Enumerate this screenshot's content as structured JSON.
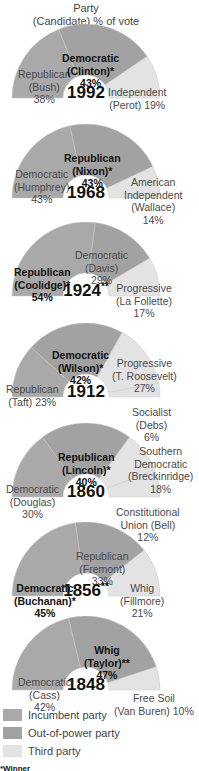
{
  "header": {
    "line1": "Party",
    "line2": "(Candidate) % of vote"
  },
  "colors": {
    "incumbent": "#a9a9a9",
    "out_of_power": "#a2a2a2",
    "third": "#e3e3e3"
  },
  "legend": [
    {
      "label": "Incumbent party",
      "color": "#a9a9a9"
    },
    {
      "label": "Out-of-power party",
      "color": "#a2a2a2"
    },
    {
      "label": "Third party",
      "color": "#e3e3e3"
    }
  ],
  "footnote": "*Winner",
  "charts": [
    {
      "year": "1992",
      "mark": "",
      "labels": [
        {
          "l1": "Republican",
          "l2": "(Bush)",
          "l3": "38%",
          "win": false
        },
        {
          "l1": "Democratic",
          "l2": "(Clinton)*",
          "l3": "43%",
          "win": true
        },
        {
          "l1": "Independent",
          "l2": "(Perot) 19%",
          "l3": "",
          "win": false
        }
      ]
    },
    {
      "year": "1968",
      "mark": "",
      "labels": [
        {
          "l1": "Democratic",
          "l2": "(Humphrey)",
          "l3": "43%",
          "win": false
        },
        {
          "l1": "Republican",
          "l2": "(Nixon)*",
          "l3": "43%",
          "win": true
        },
        {
          "l1": "American",
          "l2": "Independent",
          "l3": "(Wallace)",
          "l4": "14%",
          "win": false
        }
      ]
    },
    {
      "year": "1924",
      "mark": "**",
      "labels": [
        {
          "l1": "Republican",
          "l2": "(Coolidge)*",
          "l3": "54%",
          "win": true
        },
        {
          "l1": "Democratic",
          "l2": "(Davis)",
          "l3": "29%",
          "win": false
        },
        {
          "l1": "Progressive",
          "l2": "(La Follette)",
          "l3": "17%",
          "win": false
        }
      ]
    },
    {
      "year": "1912",
      "mark": "",
      "labels": [
        {
          "l1": "Republican",
          "l2": "(Taft) 23%",
          "l3": "",
          "win": false
        },
        {
          "l1": "Democratic",
          "l2": "(Wilson)*",
          "l3": "42%",
          "win": true
        },
        {
          "l1": "Progressive",
          "l2": "(T. Roosevelt)",
          "l3": "27%",
          "win": false
        },
        {
          "l1": "Socialist",
          "l2": "(Debs)",
          "l3": "6%",
          "win": false
        }
      ]
    },
    {
      "year": "1860",
      "mark": "",
      "labels": [
        {
          "l1": "Democratic",
          "l2": "(Douglas)",
          "l3": "30%",
          "win": false
        },
        {
          "l1": "Republican",
          "l2": "(Lincoln)*",
          "l3": "40%",
          "win": true
        },
        {
          "l1": "Southern",
          "l2": "Democratic",
          "l3": "(Breckinridge)",
          "l4": "18%",
          "win": false
        },
        {
          "l1": "Constitutional",
          "l2": "Union (Bell)",
          "l3": "12%",
          "win": false
        }
      ]
    },
    {
      "year": "1856",
      "mark": "**",
      "labels": [
        {
          "l1": "Democratic",
          "l2": "(Buchanan)*",
          "l3": "45%",
          "win": true
        },
        {
          "l1": "Republican",
          "l2": "(Fremont)",
          "l3": "33%",
          "win": false
        },
        {
          "l1": "Whig",
          "l2": "(Fillmore)",
          "l3": "21%",
          "win": false
        }
      ]
    },
    {
      "year": "1848",
      "mark": "",
      "labels": [
        {
          "l1": "Democratic",
          "l2": "(Cass)",
          "l3": "42%",
          "win": false
        },
        {
          "l1": "Whig",
          "l2": "(Taylor)**",
          "l3": "47%",
          "win": true
        },
        {
          "l1": "Free Soil",
          "l2": "(Van Buren) 10%",
          "l3": "",
          "win": false
        }
      ]
    }
  ],
  "chart_data": {
    "type": "pie",
    "title": "Party (Candidate) % of vote",
    "legend": [
      "Incumbent party",
      "Out-of-power party",
      "Third party"
    ],
    "legend_position": "bottom",
    "charts": [
      {
        "year": 1992,
        "slices": [
          {
            "label": "Republican (Bush)",
            "value": 38,
            "role": "Incumbent party"
          },
          {
            "label": "Democratic (Clinton)*",
            "value": 43,
            "role": "Out-of-power party"
          },
          {
            "label": "Independent (Perot)",
            "value": 19,
            "role": "Third party"
          }
        ]
      },
      {
        "year": 1968,
        "slices": [
          {
            "label": "Democratic (Humphrey)",
            "value": 43,
            "role": "Incumbent party"
          },
          {
            "label": "Republican (Nixon)*",
            "value": 43,
            "role": "Out-of-power party"
          },
          {
            "label": "American Independent (Wallace)",
            "value": 14,
            "role": "Third party"
          }
        ]
      },
      {
        "year": 1924,
        "note": "**",
        "slices": [
          {
            "label": "Republican (Coolidge)*",
            "value": 54,
            "role": "Incumbent party"
          },
          {
            "label": "Democratic (Davis)",
            "value": 29,
            "role": "Out-of-power party"
          },
          {
            "label": "Progressive (La Follette)",
            "value": 17,
            "role": "Third party"
          }
        ]
      },
      {
        "year": 1912,
        "slices": [
          {
            "label": "Republican (Taft)",
            "value": 23,
            "role": "Incumbent party"
          },
          {
            "label": "Democratic (Wilson)*",
            "value": 42,
            "role": "Out-of-power party"
          },
          {
            "label": "Progressive (T. Roosevelt)",
            "value": 27,
            "role": "Third party"
          },
          {
            "label": "Socialist (Debs)",
            "value": 6,
            "role": "Third party"
          }
        ]
      },
      {
        "year": 1860,
        "slices": [
          {
            "label": "Democratic (Douglas)",
            "value": 30,
            "role": "Incumbent party"
          },
          {
            "label": "Republican (Lincoln)*",
            "value": 40,
            "role": "Out-of-power party"
          },
          {
            "label": "Southern Democratic (Breckinridge)",
            "value": 18,
            "role": "Third party"
          },
          {
            "label": "Constitutional Union (Bell)",
            "value": 12,
            "role": "Third party"
          }
        ]
      },
      {
        "year": 1856,
        "note": "**",
        "slices": [
          {
            "label": "Democratic (Buchanan)*",
            "value": 45,
            "role": "Incumbent party"
          },
          {
            "label": "Republican (Fremont)",
            "value": 33,
            "role": "Out-of-power party"
          },
          {
            "label": "Whig (Fillmore)",
            "value": 21,
            "role": "Third party"
          }
        ]
      },
      {
        "year": 1848,
        "slices": [
          {
            "label": "Democratic (Cass)",
            "value": 42,
            "role": "Incumbent party"
          },
          {
            "label": "Whig (Taylor)**",
            "value": 47,
            "role": "Out-of-power party"
          },
          {
            "label": "Free Soil (Van Buren)",
            "value": 10,
            "role": "Third party"
          }
        ]
      }
    ]
  }
}
